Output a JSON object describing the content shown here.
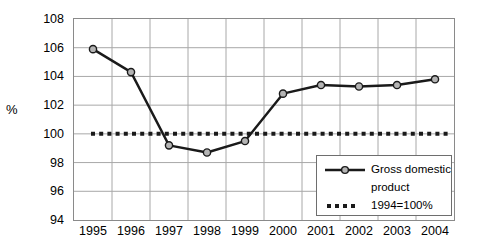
{
  "chart_data": {
    "type": "line",
    "title": "",
    "xlabel": "",
    "ylabel": "%",
    "ylim": [
      94,
      108
    ],
    "ytick_step": 2,
    "yticks": [
      108,
      106,
      104,
      102,
      100,
      98,
      96,
      94
    ],
    "categories": [
      "1995",
      "1996",
      "1997",
      "1998",
      "1999",
      "2000",
      "2001",
      "2002",
      "2003",
      "2004"
    ],
    "grid": true,
    "legend_position": "bottom-right",
    "series": [
      {
        "name": "Gross domestic product",
        "style": "line-marker",
        "marker": "circle",
        "color": "#1a1a1a",
        "marker_fill": "#b4b4b4",
        "values": [
          105.9,
          104.3,
          99.2,
          98.7,
          99.5,
          102.8,
          103.4,
          103.3,
          103.4,
          103.8
        ]
      },
      {
        "name": "1994=100%",
        "style": "dotted-reference",
        "color": "#1a1a1a",
        "constant_value": 100
      }
    ]
  },
  "legend": {
    "entries": [
      {
        "label_line1": "Gross domestic",
        "label_line2": "product",
        "sample": "line-with-circle-marker"
      },
      {
        "label_line1": "1994=100%",
        "label_line2": "",
        "sample": "square-dotted-line"
      }
    ]
  },
  "colors": {
    "series_line": "#1a1a1a",
    "marker_fill": "#b4b4b4",
    "grid": "#a8a8a8",
    "plot_border": "#8a8a8a",
    "text": "#000000",
    "background": "#ffffff"
  }
}
